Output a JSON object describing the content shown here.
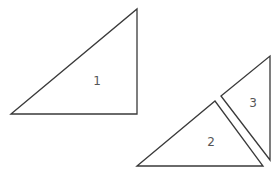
{
  "diagram": {
    "stroke_color": "#3a3a3a",
    "label_color": "#555555",
    "shapes": [
      {
        "label": "1",
        "points": "11,114 137,9 137,114",
        "label_pos": [
          97,
          81
        ]
      },
      {
        "label": "2",
        "points": "137,166 215,101 263,166",
        "label_pos": [
          211,
          142
        ]
      },
      {
        "label": "3",
        "points": "221,96 270,56 270,160",
        "label_pos": [
          253,
          103
        ]
      }
    ]
  }
}
